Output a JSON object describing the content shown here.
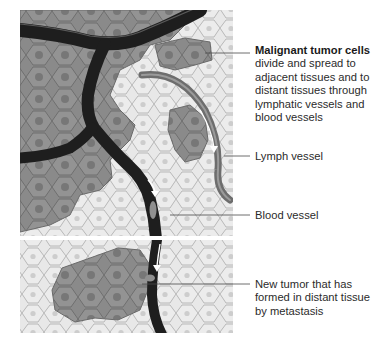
{
  "figure": {
    "panels": [
      "primary tumor tissue",
      "distant tissue"
    ]
  },
  "labels": {
    "tumor_cells": {
      "title": "Malignant tumor cells",
      "body": "divide and spread to adjacent tissues and to distant tissues through lymphatic vessels and blood vessels"
    },
    "lymph_vessel": {
      "text": "Lymph vessel"
    },
    "blood_vessel": {
      "text": "Blood vessel"
    },
    "new_tumor": {
      "text": "New tumor that has formed in distant tissue by metastasis"
    }
  },
  "colors": {
    "background": "#ffffff",
    "normal_tissue": "#e6e6e6",
    "normal_cell_border": "#b9b9b9",
    "normal_nucleus": "#cfcfcf",
    "tumor_tissue": "#8e8e8e",
    "tumor_nucleus": "#6f6f6f",
    "blood_vessel": "#1f1f1f",
    "vessel_wall": "#5a5a5a",
    "lymph_vessel": "#7a7a7a",
    "leader_line": "#4a4a4a",
    "arrow": "#ffffff"
  }
}
